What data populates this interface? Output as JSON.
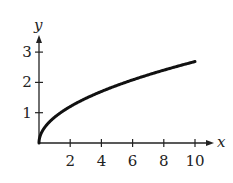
{
  "chart_data": {
    "type": "line",
    "title": "",
    "xlabel": "x",
    "ylabel": "y",
    "xlim": [
      0,
      11
    ],
    "ylim": [
      0,
      3.5
    ],
    "grid": false,
    "legend": null,
    "x_ticks": [
      2,
      4,
      6,
      8,
      10
    ],
    "x_tick_labels": [
      "2",
      "4",
      "6",
      "8",
      "10"
    ],
    "y_ticks": [
      1,
      2,
      3
    ],
    "y_tick_labels": [
      "1",
      "2",
      "3"
    ],
    "series": [
      {
        "name": "curve",
        "description": "increasing concave square-root-like curve from origin",
        "x": [
          0,
          0.25,
          0.5,
          1,
          2,
          3,
          4,
          5,
          6,
          7,
          8,
          9,
          10
        ],
        "y": [
          0,
          0.43,
          0.6,
          0.85,
          1.2,
          1.47,
          1.7,
          1.9,
          2.08,
          2.25,
          2.4,
          2.55,
          2.69
        ]
      }
    ],
    "color": "#111111"
  },
  "axes": {
    "x_label": "x",
    "y_label": "y",
    "x_tick_labels": [
      "2",
      "4",
      "6",
      "8",
      "10"
    ],
    "y_tick_labels": [
      "1",
      "2",
      "3"
    ]
  }
}
